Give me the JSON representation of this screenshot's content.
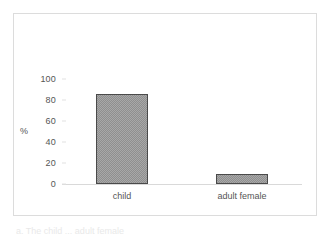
{
  "figure": {
    "caption_fragment": "a. The child  ... adult female",
    "frame_color": "#dcdcdc",
    "background_color": "#ffffff"
  },
  "chart_data": {
    "type": "bar",
    "title": "",
    "xlabel": "",
    "ylabel": "%",
    "categories": [
      "child",
      "adult female"
    ],
    "values": [
      86,
      10
    ],
    "ylim": [
      0,
      100
    ],
    "yticks": [
      0,
      20,
      40,
      60,
      80,
      100
    ],
    "ytick_labels": [
      "0",
      "20",
      "40",
      "60",
      "80",
      "100"
    ],
    "grid": false,
    "legend": "none",
    "bar_fill_color": "#a8a8a8",
    "bar_pattern": "dither-checker",
    "bar_border_color": "#4a4a4a",
    "axis_color": "#d9d9d9",
    "text_color": "#555555"
  }
}
